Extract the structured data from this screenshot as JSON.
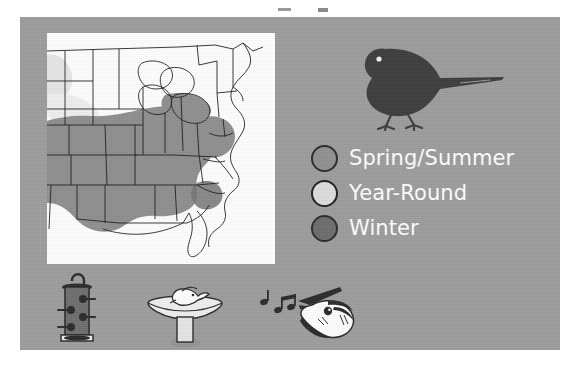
{
  "figure": {
    "panel_background_color": "#9d9d9d",
    "map_background_color": "#ffffff"
  },
  "range_map": {
    "name": "eastern-united-states-range-map",
    "outline_color": "#1a1a1a",
    "shading_colors": {
      "spring_summer": "#8d8d8d",
      "year_round": "#e8e8e8",
      "winter": "#6f6f6f",
      "no_range": "#ffffff"
    }
  },
  "bird": {
    "name": "bird-silhouette",
    "color": "#3b3b3b",
    "eye_color": "#ffffff"
  },
  "legend": {
    "items": [
      {
        "label": "Spring/Summer",
        "swatch_color": "#919191",
        "swatch_border": "#2b2b2b"
      },
      {
        "label": "Year-Round",
        "swatch_color": "#dedede",
        "swatch_border": "#1f1f1f"
      },
      {
        "label": "Winter",
        "swatch_color": "#6d6d6d",
        "swatch_border": "#2b2b2b"
      }
    ],
    "text_color": "#ffffff"
  },
  "icons": [
    {
      "name": "tube-bird-feeder-icon",
      "label": "bird feeder"
    },
    {
      "name": "bird-bath-icon",
      "label": "bird bath"
    },
    {
      "name": "singing-bird-head-icon",
      "label": "bird song"
    }
  ]
}
